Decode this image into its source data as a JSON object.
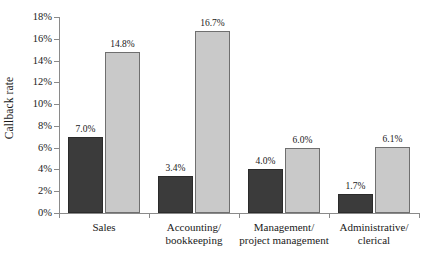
{
  "chart_data": {
    "type": "bar",
    "title": "",
    "xlabel": "",
    "ylabel": "Callback rate",
    "ylim": [
      0,
      18
    ],
    "ytick_labels": [
      "0%",
      "2%",
      "4%",
      "6%",
      "8%",
      "10%",
      "12%",
      "14%",
      "16%",
      "18%"
    ],
    "ytick_values": [
      0,
      2,
      4,
      6,
      8,
      10,
      12,
      14,
      16,
      18
    ],
    "grid": false,
    "legend": "none",
    "categories": [
      "Sales",
      "Accounting/ bookkeeping",
      "Management/ project management",
      "Administrative/ clerical"
    ],
    "category_lines": [
      [
        "Sales"
      ],
      [
        "Accounting/",
        "bookkeeping"
      ],
      [
        "Management/",
        "project management"
      ],
      [
        "Administrative/",
        "clerical"
      ]
    ],
    "series": [
      {
        "name": "dark",
        "color": "#3b3b3b",
        "values": [
          7.0,
          3.4,
          4.0,
          1.7
        ],
        "labels": [
          "7.0%",
          "3.4%",
          "4.0%",
          "1.7%"
        ]
      },
      {
        "name": "light",
        "color": "#c9c9c9",
        "values": [
          14.8,
          16.7,
          6.0,
          6.1
        ],
        "labels": [
          "14.8%",
          "16.7%",
          "6.0%",
          "6.1%"
        ]
      }
    ]
  },
  "axis": {
    "axis_color": "#8a8a8a"
  }
}
